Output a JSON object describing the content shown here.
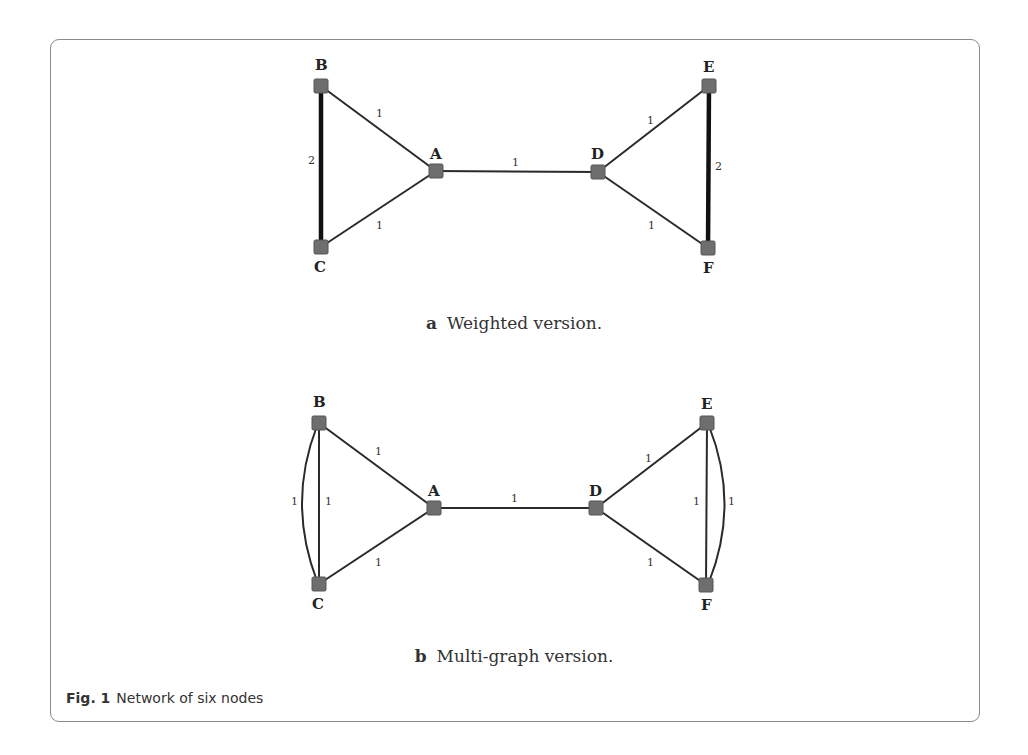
{
  "figure": {
    "number": "Fig. 1",
    "caption": "Network of six nodes",
    "panels": [
      {
        "letter": "a",
        "title": "Weighted version.",
        "nodes": [
          {
            "id": "B",
            "label": "B"
          },
          {
            "id": "A",
            "label": "A"
          },
          {
            "id": "C",
            "label": "C"
          },
          {
            "id": "D",
            "label": "D"
          },
          {
            "id": "E",
            "label": "E"
          },
          {
            "id": "F",
            "label": "F"
          }
        ],
        "edges": [
          {
            "from": "B",
            "to": "A",
            "weight": "1"
          },
          {
            "from": "C",
            "to": "A",
            "weight": "1"
          },
          {
            "from": "B",
            "to": "C",
            "weight": "2"
          },
          {
            "from": "A",
            "to": "D",
            "weight": "1"
          },
          {
            "from": "D",
            "to": "E",
            "weight": "1"
          },
          {
            "from": "D",
            "to": "F",
            "weight": "1"
          },
          {
            "from": "E",
            "to": "F",
            "weight": "2"
          }
        ]
      },
      {
        "letter": "b",
        "title": "Multi-graph version.",
        "nodes": [
          {
            "id": "B",
            "label": "B"
          },
          {
            "id": "A",
            "label": "A"
          },
          {
            "id": "C",
            "label": "C"
          },
          {
            "id": "D",
            "label": "D"
          },
          {
            "id": "E",
            "label": "E"
          },
          {
            "id": "F",
            "label": "F"
          }
        ],
        "edges": [
          {
            "from": "B",
            "to": "A",
            "weight": "1"
          },
          {
            "from": "C",
            "to": "A",
            "weight": "1"
          },
          {
            "from": "B",
            "to": "C",
            "weight": "1",
            "kind": "straight"
          },
          {
            "from": "B",
            "to": "C",
            "weight": "1",
            "kind": "curved"
          },
          {
            "from": "A",
            "to": "D",
            "weight": "1"
          },
          {
            "from": "D",
            "to": "E",
            "weight": "1"
          },
          {
            "from": "D",
            "to": "F",
            "weight": "1"
          },
          {
            "from": "E",
            "to": "F",
            "weight": "1",
            "kind": "straight"
          },
          {
            "from": "E",
            "to": "F",
            "weight": "1",
            "kind": "curved"
          }
        ]
      }
    ]
  },
  "colors": {
    "node_fill": "#6e6e6e",
    "edge": "#2a2a2a",
    "border": "#8a8a8a"
  }
}
